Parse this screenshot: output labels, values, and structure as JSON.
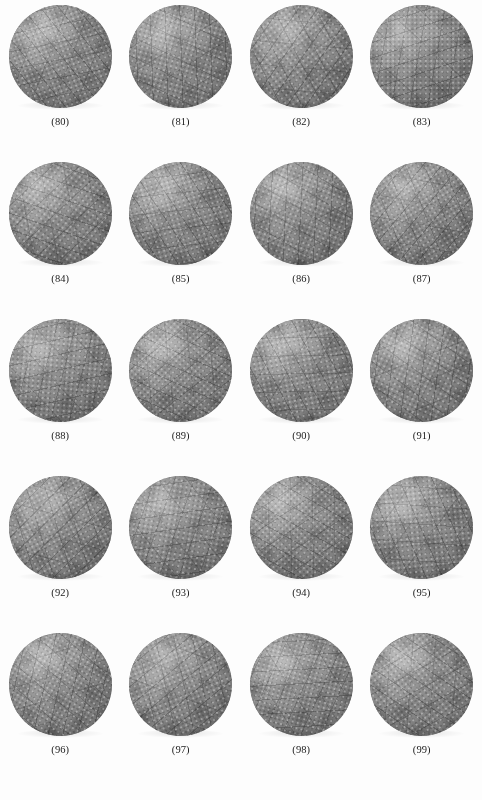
{
  "figure": {
    "type": "image-plate",
    "background_color": "#fdfdfd",
    "sphere_color": "#8d8d8d",
    "caption_color": "#1a1a1a",
    "columns": 4,
    "rows": 5,
    "count": 20
  },
  "items": [
    {
      "caption": "(80)",
      "number": 80,
      "icon": "textured-sphere-icon"
    },
    {
      "caption": "(81)",
      "number": 81,
      "icon": "textured-sphere-icon"
    },
    {
      "caption": "(82)",
      "number": 82,
      "icon": "textured-sphere-icon"
    },
    {
      "caption": "(83)",
      "number": 83,
      "icon": "textured-sphere-icon"
    },
    {
      "caption": "(84)",
      "number": 84,
      "icon": "textured-sphere-icon"
    },
    {
      "caption": "(85)",
      "number": 85,
      "icon": "textured-sphere-icon"
    },
    {
      "caption": "(86)",
      "number": 86,
      "icon": "textured-sphere-icon"
    },
    {
      "caption": "(87)",
      "number": 87,
      "icon": "textured-sphere-icon"
    },
    {
      "caption": "(88)",
      "number": 88,
      "icon": "textured-sphere-icon"
    },
    {
      "caption": "(89)",
      "number": 89,
      "icon": "textured-sphere-icon"
    },
    {
      "caption": "(90)",
      "number": 90,
      "icon": "textured-sphere-icon"
    },
    {
      "caption": "(91)",
      "number": 91,
      "icon": "textured-sphere-icon"
    },
    {
      "caption": "(92)",
      "number": 92,
      "icon": "textured-sphere-icon"
    },
    {
      "caption": "(93)",
      "number": 93,
      "icon": "textured-sphere-icon"
    },
    {
      "caption": "(94)",
      "number": 94,
      "icon": "textured-sphere-icon"
    },
    {
      "caption": "(95)",
      "number": 95,
      "icon": "textured-sphere-icon"
    },
    {
      "caption": "(96)",
      "number": 96,
      "icon": "textured-sphere-icon"
    },
    {
      "caption": "(97)",
      "number": 97,
      "icon": "textured-sphere-icon"
    },
    {
      "caption": "(98)",
      "number": 98,
      "icon": "textured-sphere-icon"
    },
    {
      "caption": "(99)",
      "number": 99,
      "icon": "textured-sphere-icon"
    }
  ]
}
